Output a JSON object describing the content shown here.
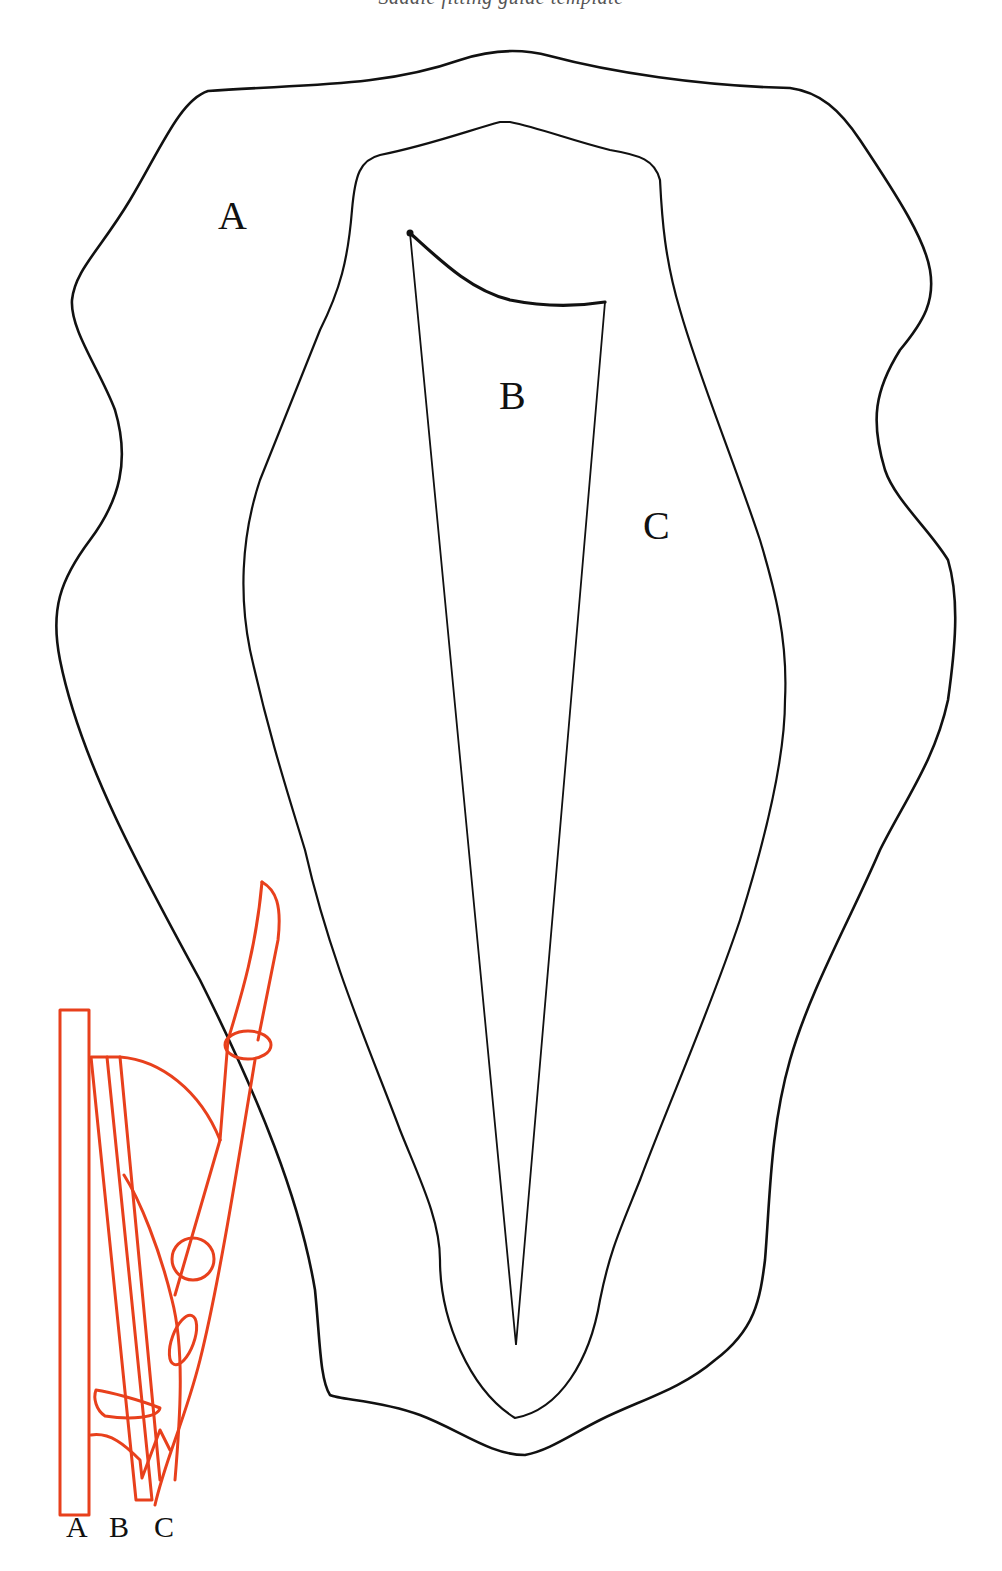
{
  "header": {
    "caption_cropped": "Saddle fitting guide template"
  },
  "diagram": {
    "region_labels": [
      {
        "id": "A",
        "text": "A",
        "description": "outer panel region"
      },
      {
        "id": "B",
        "text": "B",
        "description": "central tapered wedge"
      },
      {
        "id": "C",
        "text": "C",
        "description": "middle panel region"
      }
    ],
    "cross_section": {
      "description": "red cross-section side view",
      "labels": [
        "A",
        "B",
        "C"
      ]
    },
    "colors": {
      "outline": "#111111",
      "cross_section": "#E8401C",
      "background": "#FFFFFF"
    }
  }
}
